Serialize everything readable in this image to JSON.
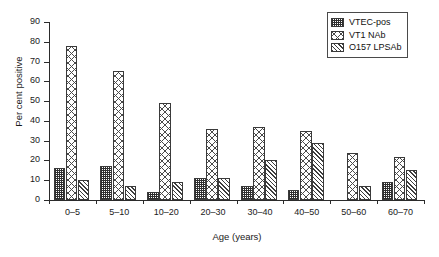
{
  "chart_data": {
    "type": "bar",
    "title": "",
    "xlabel": "Age (years)",
    "ylabel": "Per cent positive",
    "categories": [
      "0–5",
      "5–10",
      "10–20",
      "20–30",
      "30–40",
      "40–50",
      "50–60",
      "60–70"
    ],
    "series": [
      {
        "name": "VTEC-pos",
        "values": [
          16,
          17,
          4,
          11,
          7,
          5,
          0,
          9
        ]
      },
      {
        "name": "VT1 NAb",
        "values": [
          78,
          65,
          49,
          36,
          37,
          35,
          24,
          22
        ]
      },
      {
        "name": "O157 LPSAb",
        "values": [
          10,
          7,
          9,
          11,
          20,
          29,
          7,
          15
        ]
      }
    ],
    "ylim": [
      0,
      90
    ],
    "yticks": [
      0,
      10,
      20,
      30,
      40,
      50,
      60,
      70,
      80,
      90
    ],
    "ytick_labels": [
      "0",
      "10",
      "20",
      "30",
      "40",
      "50",
      "60",
      "70",
      "80",
      "90"
    ],
    "grid": false,
    "legend_position": "top-right"
  },
  "legend": {
    "items": [
      {
        "label": "VTEC-pos",
        "pattern": "dense-grid-dark"
      },
      {
        "label": "VT1 NAb",
        "pattern": "large-cross-hatch"
      },
      {
        "label": "O157 LPSAb",
        "pattern": "diagonal-hatch"
      }
    ]
  }
}
